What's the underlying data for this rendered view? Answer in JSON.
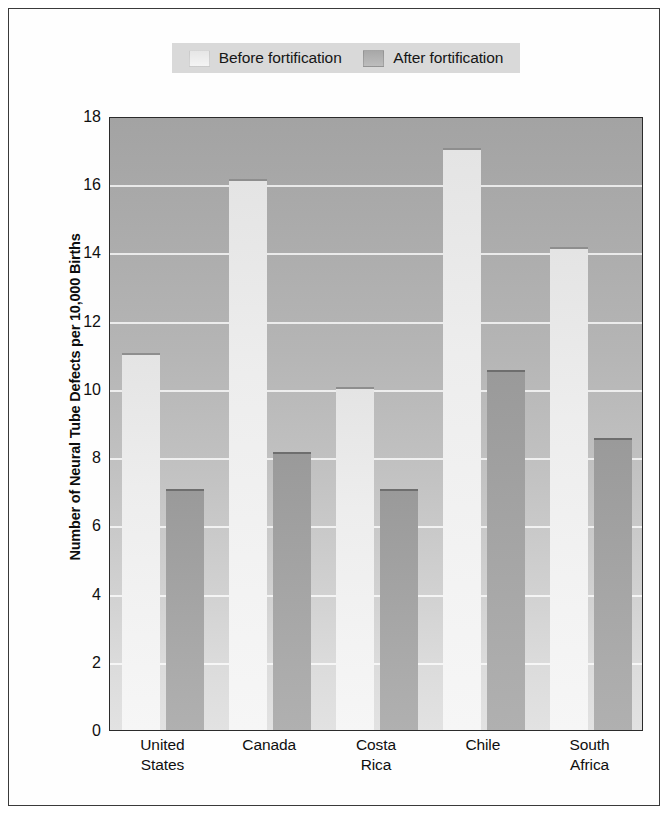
{
  "chart_data": {
    "type": "bar",
    "title": "",
    "subtitle": "",
    "xlabel": "",
    "ylabel": "Number of Neural Tube Defects per 10,000 Births",
    "categories": [
      "United States",
      "Canada",
      "Costa Rica",
      "Chile",
      "South Africa"
    ],
    "category_lines": [
      [
        "United",
        "States"
      ],
      [
        "Canada"
      ],
      [
        "Costa",
        "Rica"
      ],
      [
        "Chile"
      ],
      [
        "South",
        "Africa"
      ]
    ],
    "series": [
      {
        "name": "Before fortification",
        "color": "#f0f0f0",
        "values": [
          11.0,
          16.1,
          10.0,
          17.0,
          14.1
        ]
      },
      {
        "name": "After fortification",
        "color": "#a6a6a6",
        "values": [
          7.0,
          8.1,
          7.0,
          10.5,
          8.5
        ]
      }
    ],
    "ylim": [
      0,
      18
    ],
    "ytick_step": 2,
    "yticks": [
      "0",
      "2",
      "4",
      "6",
      "8",
      "10",
      "12",
      "14",
      "16",
      "18"
    ],
    "grid": true,
    "grid_color": "#ffffff",
    "legend_position": "top",
    "plot_background": "gray-gradient",
    "frame_color": "#2b2b2b"
  },
  "legend": {
    "entries": [
      {
        "label": "Before fortification",
        "swatch": "before-swatch"
      },
      {
        "label": "After fortification",
        "swatch": "after-swatch"
      }
    ]
  }
}
